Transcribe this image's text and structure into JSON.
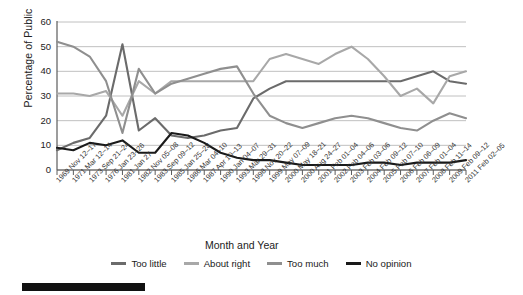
{
  "axes": {
    "ylabel": "Percentage of Public",
    "xlabel": "Month and Year",
    "yticks": [
      "0",
      "10",
      "20",
      "30",
      "40",
      "50",
      "60"
    ]
  },
  "legend": [
    {
      "label": "Too little",
      "color": "#6b6b6b",
      "icon": "line-swatch-too-little"
    },
    {
      "label": "About right",
      "color": "#a8a8a8",
      "icon": "line-swatch-about-right"
    },
    {
      "label": "Too much",
      "color": "#8f8f8f",
      "icon": "line-swatch-too-much"
    },
    {
      "label": "No opinion",
      "color": "#1a1a1a",
      "icon": "line-swatch-no-opinion"
    }
  ],
  "chart_data": {
    "type": "line",
    "title": "",
    "xlabel": "Month and Year",
    "ylabel": "Percentage of Public",
    "ylim": [
      0,
      60
    ],
    "ytick_step": 10,
    "grid": "horizontal",
    "legend_position": "bottom",
    "categories": [
      "1969 Nov 12–17",
      "1971 Mar 12–14",
      "1973 Sep 21–24",
      "1976 Jan 23–26",
      "1981 Jan 27",
      "1982 Nov 05–08",
      "1983 Sep 09–12",
      "1985 Jan 25–28",
      "1986 Mar 04–10",
      "1987 Apr 10–13",
      "1990 Jan 04–07",
      "1993 Mar 29–31",
      "1998 Nov 20–22",
      "1999 May 07–09",
      "2000 May 18–21",
      "2000 Aug 24–27",
      "2001 Feb 01–04",
      "2002 Feb 04–06",
      "2003 Feb 03–06",
      "2004 Feb 09–12",
      "2005 Feb 07–10",
      "2006 Feb 06–09",
      "2007 Feb 01–04",
      "2008 Feb 11–14",
      "2009 Feb 09–12",
      "2011 Feb 02–05"
    ],
    "series": [
      {
        "name": "Too little",
        "color": "#6b6b6b",
        "values": [
          8,
          11,
          13,
          22,
          51,
          16,
          21,
          14,
          13,
          14,
          16,
          17,
          29,
          33,
          36,
          36,
          36,
          36,
          36,
          36,
          36,
          36,
          38,
          40,
          36,
          35
        ]
      },
      {
        "name": "About right",
        "color": "#a8a8a8",
        "values": [
          31,
          31,
          30,
          32,
          22,
          36,
          31,
          36,
          36,
          36,
          36,
          36,
          36,
          45,
          47,
          45,
          43,
          47,
          50,
          45,
          38,
          30,
          33,
          27,
          38,
          40
        ]
      },
      {
        "name": "Too much",
        "color": "#8f8f8f",
        "values": [
          52,
          50,
          46,
          36,
          15,
          41,
          31,
          35,
          37,
          39,
          41,
          42,
          31,
          22,
          19,
          17,
          19,
          21,
          22,
          21,
          19,
          17,
          16,
          20,
          23,
          21
        ]
      },
      {
        "name": "No opinion",
        "color": "#1a1a1a",
        "values": [
          9,
          8,
          11,
          10,
          12,
          7,
          7,
          15,
          14,
          11,
          7,
          5,
          4,
          4,
          3,
          2,
          2,
          2,
          2,
          3,
          3,
          2,
          3,
          3,
          3,
          4
        ]
      }
    ]
  }
}
